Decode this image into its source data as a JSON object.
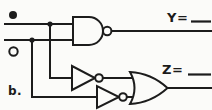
{
  "diagram": {
    "kind": "logic-circuit",
    "part_label": "b.",
    "outputs": {
      "y_label": "Y=",
      "z_label": "Z="
    },
    "inputs": {
      "marker_top": "filled-dot",
      "marker_bottom": "open-circle"
    },
    "gates": [
      "nand",
      "not",
      "not",
      "or"
    ],
    "connections": [
      "input-1 -> nand.in1",
      "input-1 -> not-1.in",
      "input-2 -> nand.in2",
      "input-2 -> not-2.in",
      "not-1.out -> or.in1",
      "not-2.out -> or.in2",
      "nand.out -> Y",
      "or.out -> Z"
    ],
    "colors": {
      "ink": "#1c1c1c",
      "paper": "#fbfbf9"
    }
  }
}
